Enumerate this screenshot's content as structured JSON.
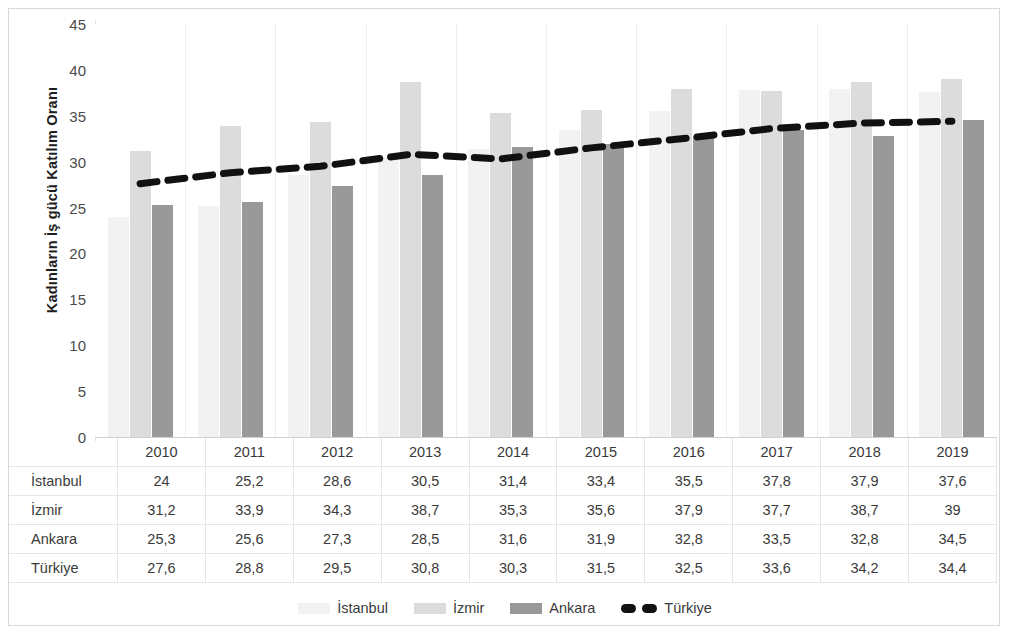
{
  "axis": {
    "y_title": "Kadınların İş gücü Katılım Oranı",
    "y_ticks": [
      "45",
      "40",
      "35",
      "30",
      "25",
      "20",
      "15",
      "10",
      "5",
      "0"
    ]
  },
  "legend": {
    "items": [
      {
        "label": "İstanbul",
        "marker": "bar-swatch-istanbul",
        "color": "#F2F2F2"
      },
      {
        "label": "İzmir",
        "marker": "bar-swatch-izmir",
        "color": "#DCDCDC"
      },
      {
        "label": "Ankara",
        "marker": "bar-swatch-ankara",
        "color": "#999999"
      },
      {
        "label": "Türkiye",
        "marker": "dashed-line-swatch",
        "color": "#111111"
      }
    ]
  },
  "table": {
    "corner": "",
    "columns": [
      "2010",
      "2011",
      "2012",
      "2013",
      "2014",
      "2015",
      "2016",
      "2017",
      "2018",
      "2019"
    ],
    "rows": [
      {
        "label": "İstanbul",
        "values": [
          "24",
          "25,2",
          "28,6",
          "30,5",
          "31,4",
          "33,4",
          "35,5",
          "37,8",
          "37,9",
          "37,6"
        ]
      },
      {
        "label": "İzmir",
        "values": [
          "31,2",
          "33,9",
          "34,3",
          "38,7",
          "35,3",
          "35,6",
          "37,9",
          "37,7",
          "38,7",
          "39"
        ]
      },
      {
        "label": "Ankara",
        "values": [
          "25,3",
          "25,6",
          "27,3",
          "28,5",
          "31,6",
          "31,9",
          "32,8",
          "33,5",
          "32,8",
          "34,5"
        ]
      },
      {
        "label": "Türkiye",
        "values": [
          "27,6",
          "28,8",
          "29,5",
          "30,8",
          "30,3",
          "31,5",
          "32,5",
          "33,6",
          "34,2",
          "34,4"
        ]
      }
    ]
  },
  "chart_data": {
    "type": "bar",
    "title": "",
    "xlabel": "",
    "ylabel": "Kadınların İş gücü Katılım Oranı",
    "categories": [
      "2010",
      "2011",
      "2012",
      "2013",
      "2014",
      "2015",
      "2016",
      "2017",
      "2018",
      "2019"
    ],
    "ylim": [
      0,
      45
    ],
    "ytick_step": 5,
    "grid": false,
    "legend_position": "bottom",
    "series": [
      {
        "name": "İstanbul",
        "type": "bar",
        "color": "#F2F2F2",
        "values": [
          24,
          25.2,
          28.6,
          30.5,
          31.4,
          33.4,
          35.5,
          37.8,
          37.9,
          37.6
        ]
      },
      {
        "name": "İzmir",
        "type": "bar",
        "color": "#DCDCDC",
        "values": [
          31.2,
          33.9,
          34.3,
          38.7,
          35.3,
          35.6,
          37.9,
          37.7,
          38.7,
          39
        ]
      },
      {
        "name": "Ankara",
        "type": "bar",
        "color": "#999999",
        "values": [
          25.3,
          25.6,
          27.3,
          28.5,
          31.6,
          31.9,
          32.8,
          33.5,
          32.8,
          34.5
        ]
      },
      {
        "name": "Türkiye",
        "type": "line",
        "style": "dashed",
        "color": "#111111",
        "values": [
          27.6,
          28.8,
          29.5,
          30.8,
          30.3,
          31.5,
          32.5,
          33.6,
          34.2,
          34.4
        ]
      }
    ]
  }
}
